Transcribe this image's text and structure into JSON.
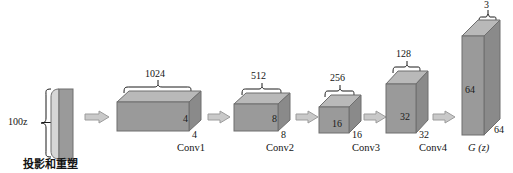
{
  "diagram": {
    "title_caption": "投影和重塑",
    "type": "dcgan-generator-architecture",
    "latent": {
      "label": "100z",
      "name": "latent-vector"
    },
    "stages": [
      {
        "id": "conv1",
        "stage_label": "Conv1",
        "channels": "1024",
        "spatial_inner": "4",
        "spatial_depth": "4"
      },
      {
        "id": "conv2",
        "stage_label": "Conv2",
        "channels": "512",
        "spatial_inner": "8",
        "spatial_depth": "8"
      },
      {
        "id": "conv3",
        "stage_label": "Conv3",
        "channels": "256",
        "spatial_inner": "16",
        "spatial_depth": "16"
      },
      {
        "id": "conv4",
        "stage_label": "Conv4",
        "channels": "128",
        "spatial_inner": "32",
        "spatial_depth": "32"
      },
      {
        "id": "output",
        "stage_label": "G (z)",
        "channels": "3",
        "spatial_inner": "64",
        "spatial_depth": "64"
      }
    ],
    "colors": {
      "block_front": "#9a9a9a",
      "block_top": "#b9b9b9",
      "block_side": "#8a8a8a",
      "outline": "#6e6e6e",
      "arrow_fill": "#c9c9c9",
      "arrow_outline": "#9c9c9c",
      "background": "#ffffff",
      "text": "#141414"
    }
  }
}
